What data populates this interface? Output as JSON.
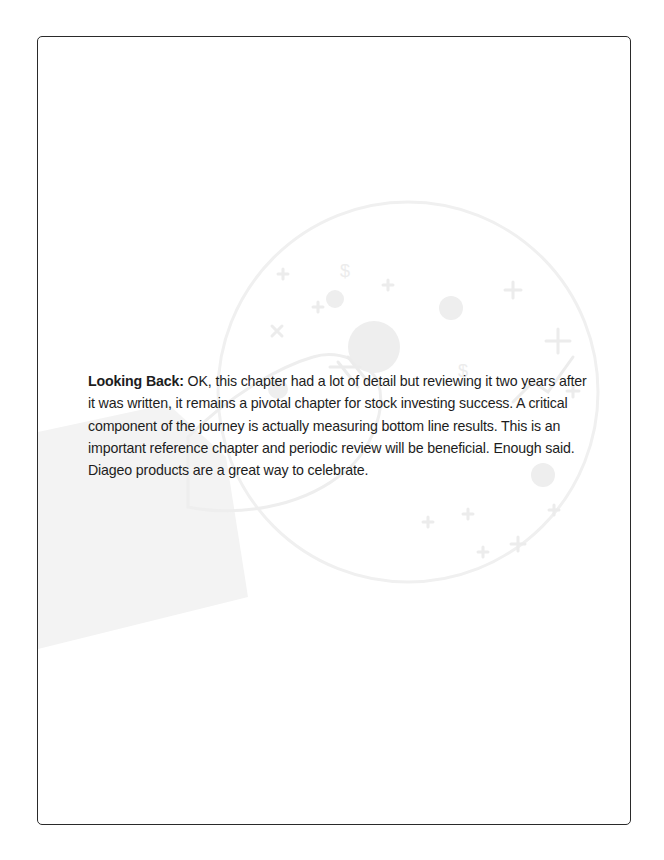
{
  "page": {
    "lead": "Looking Back:",
    "body": " OK, this chapter had a lot of detail but reviewing it two years after it was written, it remains a pivotal chapter for stock investing success. A critical component of the journey is actually measuring bottom line results. This is an important reference chapter and periodic review will be beneficial. Enough said. Diageo products are a great way to celebrate."
  },
  "watermark": {
    "icon": "hand-holding-finance-globe-icon",
    "color": "#efefef"
  }
}
